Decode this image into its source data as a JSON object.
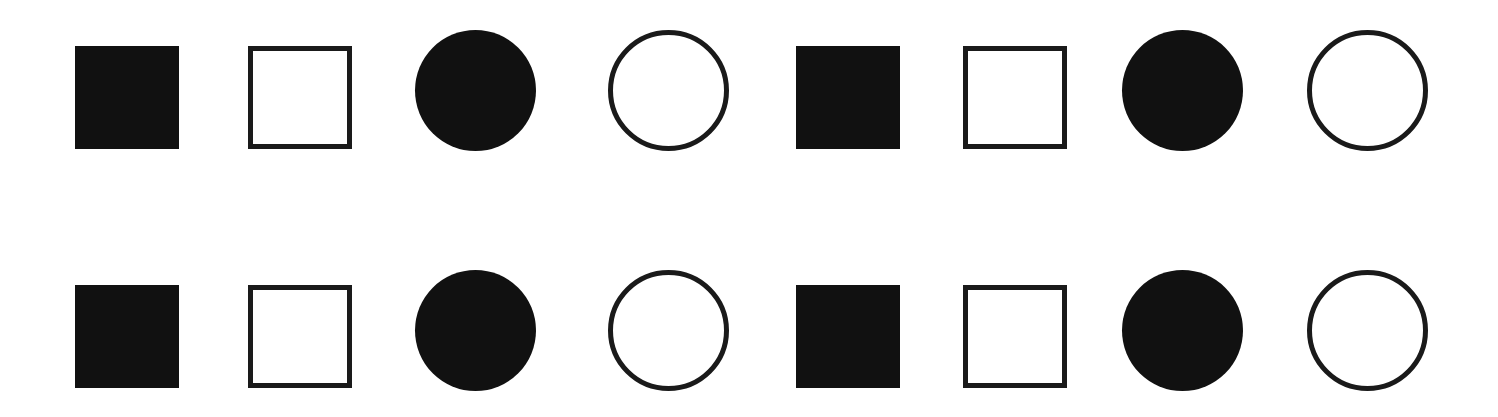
{
  "diagram": {
    "colors": {
      "fill": "#111111",
      "stroke": "#1a1a1a",
      "background": "#ffffff"
    },
    "rows": [
      {
        "row": 1,
        "shapes": [
          {
            "type": "square",
            "style": "filled"
          },
          {
            "type": "square",
            "style": "outline"
          },
          {
            "type": "circle",
            "style": "filled"
          },
          {
            "type": "circle",
            "style": "outline"
          },
          {
            "type": "square",
            "style": "filled"
          },
          {
            "type": "square",
            "style": "outline"
          },
          {
            "type": "circle",
            "style": "filled"
          },
          {
            "type": "circle",
            "style": "outline"
          }
        ]
      },
      {
        "row": 2,
        "shapes": [
          {
            "type": "square",
            "style": "filled"
          },
          {
            "type": "square",
            "style": "outline"
          },
          {
            "type": "circle",
            "style": "filled"
          },
          {
            "type": "circle",
            "style": "outline"
          },
          {
            "type": "square",
            "style": "filled"
          },
          {
            "type": "square",
            "style": "outline"
          },
          {
            "type": "circle",
            "style": "filled"
          },
          {
            "type": "circle",
            "style": "outline"
          }
        ]
      }
    ]
  }
}
